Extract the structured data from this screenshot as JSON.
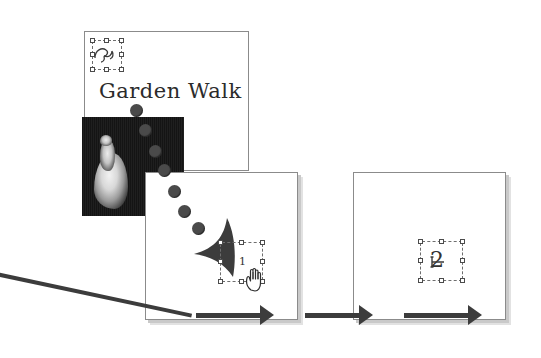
{
  "figure": {
    "type": "illustration-sequence"
  },
  "panels": [
    {
      "id": "panel-back",
      "name": "document-page-back",
      "title": "Garden Walk",
      "has_photo": true,
      "selection_label": "",
      "order": 1
    },
    {
      "id": "panel-middle",
      "name": "document-page-middle",
      "title": "",
      "has_photo": false,
      "selection_label": "1",
      "order": 2
    },
    {
      "id": "panel-right",
      "name": "document-page-right",
      "title": "",
      "has_photo": false,
      "selection_label": "2",
      "order": 3
    }
  ],
  "annotations": {
    "trail_dot_count": 7,
    "drag_arrow": "large-curved-arrowhead",
    "hand_cursor": "grabbing-hand-cursor",
    "leader_line": "callout-leader-line",
    "flow_arrow_1": "flow-arrow-right",
    "flow_arrow_2": "flow-arrow-right"
  },
  "colors": {
    "page_border": "#8b8b8b",
    "page_shadow": "#c9c9c9",
    "ink": "#3c3c3c",
    "handle_stroke": "#4b4b4b",
    "photo_dark": "#1a1a1a",
    "dot_gray": "#4a4a4a"
  }
}
